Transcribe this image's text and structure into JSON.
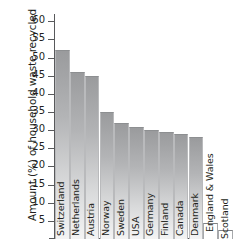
{
  "chart_data": {
    "type": "bar",
    "title": "",
    "xlabel": "",
    "ylabel": "Amount (%) of household waste recycled",
    "ylim": [
      0,
      62
    ],
    "yticks": [
      5,
      10,
      15,
      20,
      25,
      30,
      35,
      40,
      45,
      50,
      55,
      60
    ],
    "grid": false,
    "legend": "none",
    "categories": [
      "Switzerland",
      "Netherlands",
      "Austria",
      "Norway",
      "Sweden",
      "USA",
      "Germany",
      "Finland",
      "Canada",
      "Denmark",
      "England & Wales",
      "Scotland"
    ],
    "values": [
      52,
      46,
      45,
      35,
      32,
      31,
      30,
      29.5,
      29,
      28,
      4.5,
      2.5
    ],
    "bars": [
      {
        "label": "Switzerland",
        "value": 52,
        "style": "filled"
      },
      {
        "label": "Netherlands",
        "value": 46,
        "style": "filled"
      },
      {
        "label": "Austria",
        "value": 45,
        "style": "filled"
      },
      {
        "label": "Norway",
        "value": 35,
        "style": "filled"
      },
      {
        "label": "Sweden",
        "value": 32,
        "style": "filled"
      },
      {
        "label": "USA",
        "value": 31,
        "style": "filled"
      },
      {
        "label": "Germany",
        "value": 30,
        "style": "filled"
      },
      {
        "label": "Finland",
        "value": 29.5,
        "style": "filled"
      },
      {
        "label": "Canada",
        "value": 29,
        "style": "filled"
      },
      {
        "label": "Denmark",
        "value": 28,
        "style": "filled"
      },
      {
        "label": "England & Wales",
        "value": 4.5,
        "style": "empty"
      },
      {
        "label": "Scotland",
        "value": 2.5,
        "style": "empty"
      }
    ],
    "colors": {
      "bar_top": "#9a9b9d",
      "bar_bottom": "#f4f4f4",
      "axis": "#58595b",
      "text": "#231f20",
      "background": "#ffffff"
    }
  }
}
